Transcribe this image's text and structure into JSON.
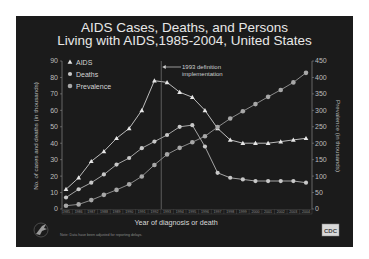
{
  "slide": {
    "title_line1": "AIDS Cases, Deaths, and Persons",
    "title_line2": "Living with AIDS,1985-2004, United States",
    "note": "Note: Data have been adjusted for reporting delays.",
    "logo_left": "hhs-eagle-icon",
    "logo_right_text": "CDC"
  },
  "chart_data": {
    "type": "line",
    "title": "AIDS Cases, Deaths, and Persons Living with AIDS,1985-2004, United States",
    "xlabel": "Year of diagnosis or death",
    "ylabel": "No. of cases and deaths (in thousands)",
    "ylabel_right": "Prevalence (in thousands)",
    "x": [
      "1985",
      "1986",
      "1987",
      "1988",
      "1989",
      "1990",
      "1991",
      "1992",
      "1993",
      "1994",
      "1995",
      "1996",
      "1997",
      "1998",
      "1999",
      "2000",
      "2001",
      "2002",
      "2003",
      "2004"
    ],
    "ylim": [
      0,
      90
    ],
    "yticks": [
      "0",
      "10",
      "20",
      "30",
      "40",
      "50",
      "60",
      "70",
      "80",
      "90"
    ],
    "ylim_right": [
      0,
      450
    ],
    "yticks_right": [
      "0",
      "50",
      "100",
      "150",
      "200",
      "250",
      "300",
      "350",
      "400",
      "450"
    ],
    "grid": false,
    "legend_position": "upper left",
    "series": [
      {
        "name": "AIDS",
        "axis": "left",
        "marker": "triangle",
        "color": "#e6e6e6",
        "values": [
          12,
          19,
          29,
          35,
          43,
          49,
          60,
          78,
          77,
          71,
          68,
          60,
          49,
          42,
          40,
          40,
          40,
          41,
          42,
          43
        ]
      },
      {
        "name": "Deaths",
        "axis": "left",
        "marker": "diamond",
        "color": "#c8c8c8",
        "values": [
          7,
          12,
          16,
          21,
          27,
          31,
          37,
          41,
          45,
          50,
          51,
          38,
          22,
          19,
          18,
          17,
          17,
          17,
          17,
          16
        ]
      },
      {
        "name": "Prevalence",
        "axis": "right",
        "marker": "square",
        "color": "#a8a8a8",
        "values": [
          10,
          14,
          27,
          43,
          58,
          75,
          99,
          134,
          166,
          186,
          203,
          221,
          249,
          275,
          297,
          319,
          341,
          362,
          385,
          414
        ]
      }
    ],
    "annotations": [
      {
        "text_line1": "1993 definition",
        "text_line2": "implementation",
        "x_between": [
          "1992",
          "1993"
        ],
        "type": "vertical-line-with-arrow"
      }
    ]
  }
}
